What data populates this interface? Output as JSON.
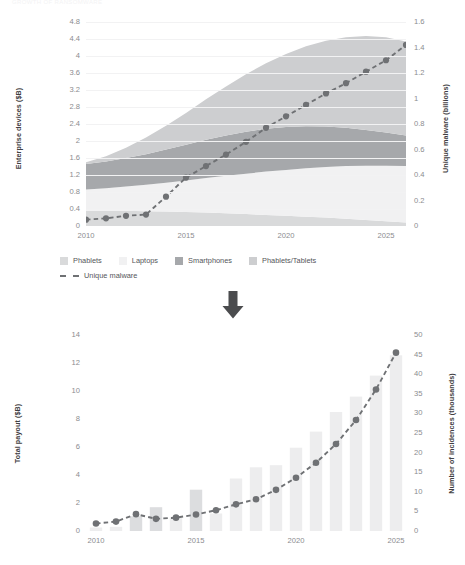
{
  "banner": {
    "text": "GROWTH  OF  RANSOMWARE"
  },
  "arrow": {
    "name": "down-arrow",
    "color": "#4b4c4e"
  },
  "palette": {
    "phablets": "#d9dadb",
    "laptops": "#f1f1f2",
    "smartphones": "#a6a8ab",
    "phablets_tablets": "#cdced0",
    "line": "#6f7174",
    "marker": "#6f7174",
    "bar": "#ededee",
    "bar_dark": "#dcdddf",
    "grid": "#f2f2f3",
    "tick_text": "#8b8c8f",
    "axis_title": "#3f4042"
  },
  "top_chart": {
    "legend": [
      {
        "label": "Phablets",
        "color": "#d9dadb",
        "type": "swatch"
      },
      {
        "label": "Laptops",
        "color": "#f1f1f2",
        "type": "swatch"
      },
      {
        "label": "Smartphones",
        "color": "#a6a8ab",
        "type": "swatch"
      },
      {
        "label": "Phablets/Tablets",
        "color": "#cdced0",
        "type": "swatch"
      },
      {
        "label": "Unique malware",
        "color": "#6f7174",
        "type": "dashed-line"
      }
    ]
  },
  "chart_data": [
    {
      "type": "area",
      "title": "",
      "xlabel": "",
      "ylabel": "Enterprise devices ($B)",
      "y2label": "Unique malware (billions)",
      "x": [
        2010,
        2011,
        2012,
        2013,
        2014,
        2015,
        2016,
        2017,
        2018,
        2019,
        2020,
        2021,
        2022,
        2023,
        2024,
        2025,
        2026
      ],
      "xticks": [
        2010,
        2015,
        2020,
        2025
      ],
      "xlim": [
        2010,
        2026
      ],
      "ylim": [
        0,
        4.8
      ],
      "yticks": [
        0,
        0.4,
        0.8,
        1.2,
        1.6,
        2.0,
        2.4,
        2.8,
        3.2,
        3.6,
        4.0,
        4.4,
        4.8
      ],
      "y2lim": [
        0,
        1.6
      ],
      "y2ticks": [
        0,
        0.2,
        0.4,
        0.6,
        0.8,
        1.0,
        1.2,
        1.4,
        1.6
      ],
      "grid": true,
      "legend_position": "below",
      "stacked": true,
      "series": [
        {
          "name": "Phablets",
          "color": "#d9dadb",
          "axis": "left",
          "values": [
            0.36,
            0.36,
            0.36,
            0.35,
            0.34,
            0.33,
            0.32,
            0.3,
            0.28,
            0.26,
            0.24,
            0.22,
            0.2,
            0.17,
            0.14,
            0.11,
            0.08
          ]
        },
        {
          "name": "Laptops",
          "color": "#f1f1f2",
          "axis": "left",
          "values": [
            0.5,
            0.53,
            0.57,
            0.62,
            0.68,
            0.74,
            0.81,
            0.88,
            0.95,
            1.02,
            1.08,
            1.14,
            1.19,
            1.24,
            1.28,
            1.31,
            1.33
          ]
        },
        {
          "name": "Smartphones",
          "color": "#a6a8ab",
          "axis": "left",
          "values": [
            0.6,
            0.63,
            0.67,
            0.72,
            0.78,
            0.84,
            0.9,
            0.95,
            0.99,
            1.01,
            1.01,
            0.99,
            0.95,
            0.9,
            0.84,
            0.78,
            0.72
          ]
        },
        {
          "name": "Phablets/Tablets",
          "color": "#cdced0",
          "axis": "left",
          "values": [
            0.04,
            0.12,
            0.24,
            0.39,
            0.56,
            0.75,
            0.95,
            1.15,
            1.35,
            1.54,
            1.72,
            1.88,
            2.02,
            2.13,
            2.21,
            2.24,
            2.21
          ]
        },
        {
          "name": "Unique malware",
          "color": "#6f7174",
          "axis": "right",
          "type": "line-dashed-markers",
          "values": [
            0.05,
            0.06,
            0.08,
            0.09,
            0.23,
            0.38,
            0.47,
            0.56,
            0.66,
            0.77,
            0.86,
            0.95,
            1.04,
            1.12,
            1.21,
            1.3,
            1.42
          ]
        }
      ]
    },
    {
      "type": "bar",
      "title": "",
      "xlabel": "",
      "ylabel": "Total payout ($B)",
      "y2label": "Number of incidences (thousands)",
      "x": [
        2010,
        2011,
        2012,
        2013,
        2014,
        2015,
        2016,
        2017,
        2018,
        2019,
        2020,
        2021,
        2022,
        2023,
        2024,
        2025
      ],
      "xticks": [
        2010,
        2015,
        2020,
        2025
      ],
      "xlim": [
        2010,
        2025
      ],
      "ylim": [
        0,
        14
      ],
      "yticks": [
        0,
        2,
        4,
        6,
        8,
        10,
        12,
        14
      ],
      "y2lim": [
        0,
        50
      ],
      "y2ticks": [
        0,
        5,
        10,
        15,
        20,
        25,
        30,
        35,
        40,
        45,
        50
      ],
      "grid": false,
      "legend_position": "none",
      "categories": [
        "2010",
        "2011",
        "2012",
        "2013",
        "2014",
        "2015",
        "2016",
        "2017",
        "2018",
        "2019",
        "2020",
        "2021",
        "2022",
        "2023",
        "2024",
        "2025"
      ],
      "series": [
        {
          "name": "Total payout ($B)",
          "color": "#ededee",
          "axis": "left",
          "type": "bar",
          "values": [
            0.25,
            0.3,
            1.05,
            1.7,
            0.95,
            2.95,
            1.25,
            3.75,
            4.55,
            4.7,
            5.95,
            7.1,
            8.5,
            9.6,
            11.1,
            12.55
          ],
          "highlight_indices": [
            2,
            3,
            5
          ],
          "highlight_color": "#dcdddf"
        },
        {
          "name": "Number of incidences (thousands)",
          "color": "#6f7174",
          "axis": "right",
          "type": "line-dashed-markers",
          "values": [
            1.9,
            2.4,
            4.3,
            3.1,
            3.4,
            4.2,
            5.3,
            6.8,
            8.1,
            10.5,
            13.6,
            17.4,
            22.2,
            28.3,
            36.1,
            45.5
          ]
        }
      ]
    }
  ]
}
